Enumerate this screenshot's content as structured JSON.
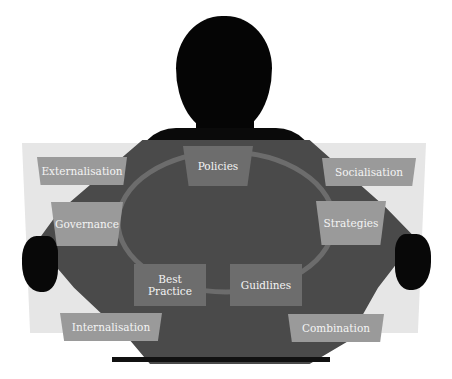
{
  "diagram": {
    "title": "",
    "outer_labels": {
      "externalisation": "Externalisation",
      "socialisation": "Socialisation",
      "internalisation": "Internalisation",
      "combination": "Combination",
      "governance": "Governance",
      "strategies": "Strategies"
    },
    "inner_labels": {
      "policies": "Policies",
      "best_practice_line1": "Best",
      "best_practice_line2": "Practice",
      "guidlines": "Guidlines"
    },
    "colors": {
      "panel": "#e6e6e6",
      "silhouette": "#050505",
      "torso": "#4a4a4a",
      "outer_box": "#9a9a9a",
      "inner_box": "#6d6d6d",
      "ring": "#707070",
      "text": "#f4f4f4"
    }
  }
}
